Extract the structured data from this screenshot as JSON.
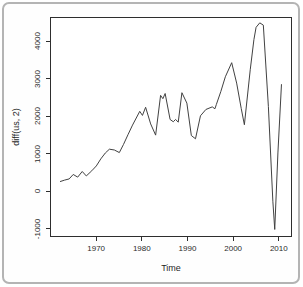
{
  "chart_data": {
    "type": "line",
    "title": "",
    "xlabel": "Time",
    "ylabel": "diff(us, 2)",
    "series_name": "diff(us, 2)",
    "x": [
      1962,
      1963,
      1964,
      1964.9,
      1965.9,
      1966.9,
      1967.8,
      1969,
      1970,
      1971,
      1972,
      1972.9,
      1974,
      1975.1,
      1976,
      1977,
      1978,
      1979.6,
      1980.2,
      1980.9,
      1982,
      1983.1,
      1984.2,
      1984.7,
      1985.2,
      1986.3,
      1987,
      1987.5,
      1988.1,
      1988.9,
      1990,
      1991,
      1991.9,
      1993,
      1994.2,
      1995.6,
      1996.2,
      1996.5,
      1997.5,
      1998.5,
      1999.9,
      2001,
      2002,
      2002.7,
      2004,
      2004.8,
      2005.3,
      2006.1,
      2006.9,
      2008,
      2009,
      2009.4,
      2010.1,
      2010.9
    ],
    "y": [
      230,
      270,
      300,
      420,
      350,
      500,
      380,
      520,
      650,
      840,
      1000,
      1100,
      1080,
      1010,
      1230,
      1490,
      1750,
      2120,
      2010,
      2230,
      1780,
      1480,
      2550,
      2460,
      2600,
      1900,
      1840,
      1900,
      1830,
      2620,
      2340,
      1470,
      1380,
      2000,
      2170,
      2240,
      2190,
      2300,
      2650,
      3050,
      3430,
      2880,
      2200,
      1760,
      3240,
      4050,
      4380,
      4500,
      4440,
      2250,
      -300,
      -1060,
      1000,
      2850
    ],
    "x_ticks": [
      1970,
      1980,
      1990,
      2000,
      2010
    ],
    "x_tick_labels": [
      "1970",
      "1980",
      "1990",
      "2000",
      "2010"
    ],
    "y_ticks": [
      -1000,
      0,
      1000,
      2000,
      3000,
      4000
    ],
    "y_tick_labels": [
      "-1000",
      "0",
      "1000",
      "2000",
      "3000",
      "4000"
    ],
    "xlim": [
      1960,
      2013
    ],
    "ylim": [
      -1235,
      4632
    ],
    "grid": false,
    "legend_position": "none",
    "line_color": "#3f3f3f",
    "axis_color": "#2e2e2e",
    "frame_border_color": "#b4b4b4",
    "background_color": "#ffffff"
  }
}
